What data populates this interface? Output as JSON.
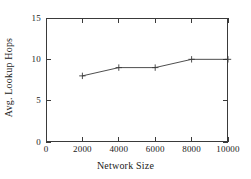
{
  "chart_data": {
    "type": "line",
    "title": "",
    "xlabel": "Network Size",
    "ylabel": "Avg. Lookup Hops",
    "x": [
      2000,
      4000,
      6000,
      8000,
      10000
    ],
    "values": [
      8,
      9,
      9,
      10,
      10
    ],
    "series": [
      {
        "name": "",
        "x": [
          2000,
          4000,
          6000,
          8000,
          10000
        ],
        "values": [
          8,
          9,
          9,
          10,
          10
        ],
        "marker": "plus",
        "color": "#3a3a3a"
      }
    ],
    "xlim": [
      0,
      10000
    ],
    "ylim": [
      0,
      15
    ],
    "xticks": [
      0,
      2000,
      4000,
      6000,
      8000,
      10000
    ],
    "yticks": [
      0,
      5,
      10,
      15
    ],
    "xtick_labels": [
      "0",
      "2000",
      "4000",
      "6000",
      "8000",
      "10000"
    ],
    "ytick_labels": [
      "0",
      "5",
      "10",
      "15"
    ],
    "grid": false,
    "legend": null,
    "frame": true,
    "line_color": "#3a3a3a",
    "axis_color": "#3a3a3a",
    "background": "#ffffff"
  }
}
